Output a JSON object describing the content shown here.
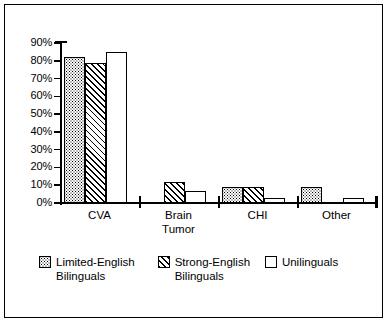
{
  "chart_data": {
    "type": "bar",
    "title": "",
    "subtitle": "",
    "xlabel": "",
    "ylabel": "",
    "categories": [
      "CVA",
      "Brain Tumor",
      "CHI",
      "Other"
    ],
    "category_lines": [
      [
        "CVA"
      ],
      [
        "Brain",
        "Tumor"
      ],
      [
        "CHI"
      ],
      [
        "Other"
      ]
    ],
    "series": [
      {
        "name": "Limited-English Bilinguals",
        "name_lines": [
          "Limited-English",
          "Bilinguals"
        ],
        "pattern": "stipple",
        "values": [
          82,
          0,
          9,
          9
        ]
      },
      {
        "name": "Strong-English Bilinguals",
        "name_lines": [
          "Strong-English",
          "Bilinguals"
        ],
        "pattern": "diagonal-hatch",
        "values": [
          79,
          12,
          9,
          0
        ]
      },
      {
        "name": "Unilinguals",
        "name_lines": [
          "Unilinguals"
        ],
        "pattern": "white",
        "values": [
          85,
          7,
          3,
          3
        ]
      }
    ],
    "ylim": [
      0,
      90
    ],
    "ytick_values": [
      0,
      10,
      20,
      30,
      40,
      50,
      60,
      70,
      80,
      90
    ],
    "ytick_labels": [
      "0%",
      "10%",
      "20%",
      "30%",
      "40%",
      "50%",
      "60%",
      "70%",
      "80%",
      "90%"
    ],
    "grid": false,
    "legend_position": "bottom",
    "colors": {
      "line": "#000000",
      "fill": "#ffffff",
      "background": "#ffffff"
    }
  }
}
